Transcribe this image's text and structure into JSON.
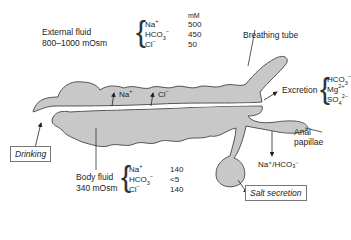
{
  "external_fluid": {
    "title": "External fluid",
    "osmolarity": "800–1000 mOsm",
    "unit": "mM",
    "ions": [
      {
        "name": "Na",
        "sup": "+",
        "sub": "",
        "value": "500"
      },
      {
        "name": "HCO",
        "sup": "−",
        "sub": "3",
        "value": "450"
      },
      {
        "name": "Cl",
        "sup": "−",
        "sub": "",
        "value": "50"
      }
    ]
  },
  "body_fluid": {
    "title": "Body fluid",
    "osmolarity": "340 mOsm",
    "ions": [
      {
        "name": "Na",
        "sup": "+",
        "sub": "",
        "value": "140"
      },
      {
        "name": "HCO",
        "sup": "−",
        "sub": "3",
        "value": "<5"
      },
      {
        "name": "Cl",
        "sup": "−",
        "sub": "",
        "value": "140"
      }
    ]
  },
  "gut_uptake": {
    "na": "Na",
    "na_sup": "+",
    "cl": "Cl",
    "cl_sup": "−"
  },
  "excretion": {
    "label": "Excretion",
    "ions": [
      {
        "name": "HCO",
        "sup": "−",
        "sub": "3"
      },
      {
        "name": "Mg",
        "sup": "2+",
        "sub": ""
      },
      {
        "name": "SO",
        "sup": "2−",
        "sub": "4"
      }
    ]
  },
  "labels": {
    "breathing_tube": "Breathing tube",
    "anal_papillae_1": "Anal",
    "anal_papillae_2": "papillae",
    "drinking": "Drinking",
    "salt_secretion": "Salt secretion",
    "papillae_flux": "Na⁺/HCO₃⁻"
  },
  "colors": {
    "body_fill": "#c8c8c8",
    "outline": "#555555",
    "text": "#222222"
  }
}
